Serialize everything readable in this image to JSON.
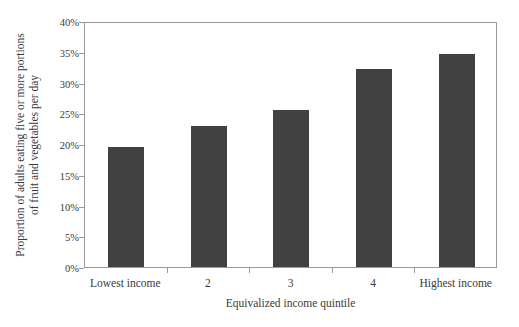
{
  "chart_data": {
    "type": "bar",
    "title": "",
    "subtitle": "",
    "categories": [
      "Lowest income",
      "2",
      "3",
      "4",
      "Highest income"
    ],
    "values": [
      19.5,
      23.0,
      25.5,
      32.2,
      34.6
    ],
    "value_labels": [
      "19.5%",
      "23%",
      "25.5%",
      "32.2%",
      "34.6%"
    ],
    "xlabel": "Equivalized income quintile",
    "ylabel_line1": "Proportion of adults eating five or more portions",
    "ylabel_line2": "of fruit and vegetables per day",
    "ylim": [
      0,
      40
    ],
    "ytick_values": [
      0,
      5,
      10,
      15,
      20,
      25,
      30,
      35,
      40
    ],
    "ytick_labels": [
      "0%",
      "5%",
      "10%",
      "15%",
      "20%",
      "25%",
      "30%",
      "35%",
      "40%"
    ],
    "grid": false,
    "legend": false,
    "legend_position": "none",
    "bar_color": "#414141",
    "axis_color": "#9a9a9a",
    "text_color": "#3a3a3a",
    "background_color": "#ffffff"
  }
}
